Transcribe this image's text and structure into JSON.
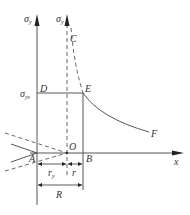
{
  "diagram": {
    "type": "plastic-zone stress distribution",
    "colors": {
      "line": "#555555",
      "text": "#333333",
      "background": "#ffffff"
    },
    "labels": {
      "sigma_y_left": "σ",
      "sigma_y_left_sub": "y",
      "sigma_y_right": "σ",
      "sigma_y_right_sub": "y",
      "sigma_ys": "σ",
      "sigma_ys_sub": "ys",
      "C": "C",
      "D": "D",
      "E": "E",
      "F": "F",
      "A": "A",
      "O": "O",
      "B": "B",
      "x_axis": "x",
      "r_y": "r",
      "r_y_sub": "y",
      "r": "r",
      "R": "R"
    }
  }
}
